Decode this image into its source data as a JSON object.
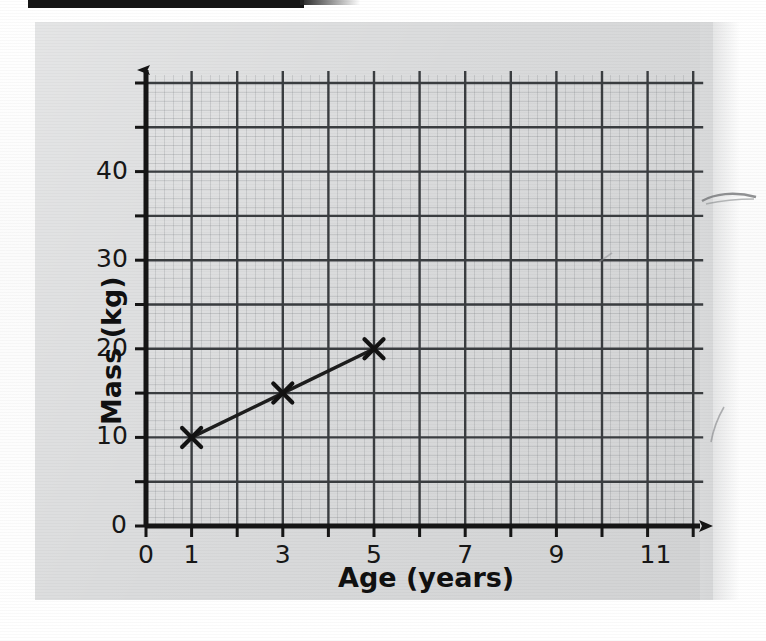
{
  "page": {
    "background_color": "#fdfdfd",
    "panel_color": "#d9dadb",
    "ink_color": "#151515"
  },
  "chart_data": {
    "type": "line",
    "title": "",
    "subtitle": "",
    "xlabel": "Age (years)",
    "ylabel": "Mass (kg)",
    "xlim": [
      0,
      12
    ],
    "ylim": [
      0,
      50
    ],
    "x": [
      1,
      3,
      5
    ],
    "values": [
      10,
      15,
      20
    ],
    "points": [
      {
        "x": 1,
        "y": 10
      },
      {
        "x": 3,
        "y": 15
      },
      {
        "x": 5,
        "y": 20
      }
    ],
    "series": [
      {
        "name": "Mass vs Age",
        "x": [
          1,
          3,
          5
        ],
        "values": [
          10,
          15,
          20
        ],
        "marker": "x",
        "line": "solid"
      }
    ],
    "x_tick_labels": [
      "0",
      "1",
      "3",
      "5",
      "7",
      "9",
      "11"
    ],
    "x_tick_values": [
      0,
      1,
      3,
      5,
      7,
      9,
      11
    ],
    "x_gridline_values": [
      0,
      1,
      2,
      3,
      4,
      5,
      6,
      7,
      8,
      9,
      10,
      11,
      12
    ],
    "x_major_step": 1,
    "y_tick_labels": [
      "0",
      "10",
      "20",
      "30",
      "40"
    ],
    "y_tick_values": [
      0,
      10,
      20,
      30,
      40
    ],
    "y_gridline_values": [
      0,
      5,
      10,
      15,
      20,
      25,
      30,
      35,
      40,
      45,
      50
    ],
    "y_major_step": 5,
    "grid": true,
    "legend": false,
    "legend_position": "none",
    "annotations": [],
    "axis_arrows": {
      "x": "right",
      "y": "up"
    },
    "marker_style": "cross",
    "line_color": "#1d1d1d",
    "grid_color": "#3a3d40"
  },
  "axes": {
    "y_title": "Mass (kg)",
    "x_title": "Age (years)",
    "origin_label": "0"
  },
  "ticks": {
    "x": [
      {
        "label": "0",
        "value": 0
      },
      {
        "label": "1",
        "value": 1
      },
      {
        "label": "3",
        "value": 3
      },
      {
        "label": "5",
        "value": 5
      },
      {
        "label": "7",
        "value": 7
      },
      {
        "label": "9",
        "value": 9
      },
      {
        "label": "11",
        "value": 11
      }
    ],
    "y": [
      {
        "label": "0",
        "value": 0
      },
      {
        "label": "10",
        "value": 10
      },
      {
        "label": "20",
        "value": 20
      },
      {
        "label": "30",
        "value": 30
      },
      {
        "label": "40",
        "value": 40
      }
    ]
  }
}
